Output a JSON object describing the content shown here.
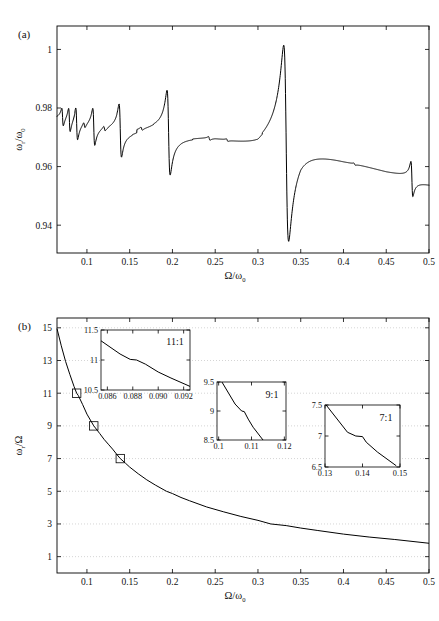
{
  "figure": {
    "panel_a_label": "(a)",
    "panel_b_label": "(b)"
  },
  "chart_data": [
    {
      "id": "panel_a",
      "type": "line",
      "title": "",
      "panel": "(a)",
      "xlabel": "Ω/ω₀",
      "ylabel": "ω_r/ω₀",
      "xlabel_parts": {
        "main": "Ω/ω",
        "sub": "0"
      },
      "ylabel_parts": {
        "num": "ω",
        "num_sub": "r",
        "den": "ω",
        "den_sub": "0"
      },
      "xlim": [
        0.065,
        0.5
      ],
      "ylim": [
        0.9305,
        1.008
      ],
      "xticks": [
        0.1,
        0.15,
        0.2,
        0.25,
        0.3,
        0.35,
        0.4,
        0.45,
        0.5
      ],
      "xticklabels": [
        "0.1",
        "0.15",
        "0.2",
        "0.25",
        "0.3",
        "0.35",
        "0.4",
        "0.45",
        "0.5"
      ],
      "yticks": [
        0.94,
        0.96,
        0.98,
        1
      ],
      "yticklabels": [
        "0.94",
        "0.96",
        "0.98",
        "1"
      ],
      "grid": false,
      "description": "Resonance-width curve with antisymmetric dispersive resonances at odd-ratio commensurabilities; baseline decays from ~0.9745 to ~0.9555.",
      "resonances": [
        {
          "x": 0.0715,
          "peak": 0.9775,
          "trough": 0.9715,
          "ratio": "13:1"
        },
        {
          "x": 0.0795,
          "peak": 0.9785,
          "trough": 0.9705,
          "ratio": "12:1"
        },
        {
          "x": 0.088,
          "peak": 0.9795,
          "trough": 0.9688,
          "ratio": "11:1"
        },
        {
          "x": 0.097,
          "peak": 0.974,
          "trough": 0.972,
          "ratio": "10.5:1"
        },
        {
          "x": 0.108,
          "peak": 0.98,
          "trough": 0.9678,
          "ratio": "9:1"
        },
        {
          "x": 0.1205,
          "peak": 0.9735,
          "trough": 0.9718,
          "ratio": "8:1"
        },
        {
          "x": 0.139,
          "peak": 0.9818,
          "trough": 0.9645,
          "ratio": "7:1"
        },
        {
          "x": 0.164,
          "peak": 0.9723,
          "trough": 0.9712,
          "ratio": "6:1"
        },
        {
          "x": 0.1955,
          "peak": 0.9848,
          "trough": 0.9573,
          "ratio": "5:1"
        },
        {
          "x": 0.243,
          "peak": 0.97,
          "trough": 0.9688,
          "ratio": "4:1"
        },
        {
          "x": 0.264,
          "peak": 0.9668,
          "trough": 0.966,
          "ratio": "3.5:1"
        },
        {
          "x": 0.333,
          "peak": 1.0005,
          "trough": 0.9362,
          "ratio": "3:1"
        },
        {
          "x": 0.413,
          "peak": 0.9628,
          "trough": 0.962,
          "ratio": "2.5:1"
        },
        {
          "x": 0.48,
          "peak": 0.9635,
          "trough": 0.9522,
          "ratio": "2:1"
        }
      ],
      "baseline": [
        {
          "x": 0.065,
          "y": 0.9745
        },
        {
          "x": 0.1,
          "y": 0.9735
        },
        {
          "x": 0.15,
          "y": 0.9718
        },
        {
          "x": 0.2,
          "y": 0.9705
        },
        {
          "x": 0.25,
          "y": 0.9682
        },
        {
          "x": 0.3,
          "y": 0.964
        },
        {
          "x": 0.35,
          "y": 0.97
        },
        {
          "x": 0.4,
          "y": 0.9645
        },
        {
          "x": 0.45,
          "y": 0.9595
        },
        {
          "x": 0.5,
          "y": 0.9555
        }
      ]
    },
    {
      "id": "panel_b",
      "type": "line",
      "title": "",
      "panel": "(b)",
      "xlabel": "Ω/ω₀",
      "ylabel": "ω_r/Ω",
      "xlabel_parts": {
        "main": "Ω/ω",
        "sub": "0"
      },
      "ylabel_parts": {
        "num": "ω",
        "num_sub": "r",
        "den": "Ω"
      },
      "xlim": [
        0.065,
        0.5
      ],
      "ylim": [
        0.0,
        15.6
      ],
      "xticks": [
        0.1,
        0.15,
        0.2,
        0.25,
        0.3,
        0.35,
        0.4,
        0.45,
        0.5
      ],
      "xticklabels": [
        "0.1",
        "0.15",
        "0.2",
        "0.25",
        "0.3",
        "0.35",
        "0.4",
        "0.45",
        "0.5"
      ],
      "yticks": [
        1,
        3,
        5,
        7,
        9,
        11,
        13,
        15
      ],
      "yticklabels": [
        "1",
        "3",
        "5",
        "7",
        "9",
        "11",
        "13",
        "15"
      ],
      "grid": true,
      "description": "Ratio of resonance frequency to drive frequency, monotonically decreasing staircase through odd integer plateaus.",
      "x": [
        0.065,
        0.07,
        0.075,
        0.08,
        0.085,
        0.088,
        0.09,
        0.095,
        0.1,
        0.108,
        0.11,
        0.115,
        0.12,
        0.125,
        0.13,
        0.135,
        0.139,
        0.145,
        0.15,
        0.16,
        0.17,
        0.18,
        0.193,
        0.2,
        0.21,
        0.22,
        0.24,
        0.26,
        0.28,
        0.3,
        0.315,
        0.333,
        0.35,
        0.37,
        0.4,
        0.43,
        0.46,
        0.5
      ],
      "y": [
        14.95,
        13.9,
        12.95,
        12.15,
        11.4,
        11.0,
        10.85,
        10.3,
        9.72,
        9.0,
        8.87,
        8.53,
        8.18,
        7.88,
        7.58,
        7.25,
        7.0,
        6.72,
        6.48,
        6.07,
        5.7,
        5.38,
        5.0,
        4.86,
        4.62,
        4.42,
        4.04,
        3.74,
        3.46,
        3.22,
        3.0,
        2.9,
        2.75,
        2.6,
        2.38,
        2.2,
        2.05,
        1.82
      ],
      "markers": [
        {
          "x": 0.088,
          "y": 11
        },
        {
          "x": 0.108,
          "y": 9
        },
        {
          "x": 0.139,
          "y": 7
        }
      ],
      "insets": [
        {
          "id": "inset_11_1",
          "label": "11:1",
          "xlim": [
            0.0855,
            0.0925
          ],
          "ylim": [
            10.5,
            11.5
          ],
          "xticks": [
            0.086,
            0.088,
            0.09,
            0.092
          ],
          "xticklabels": [
            "0.086",
            "0.088",
            "0.090",
            "0.092"
          ],
          "yticks": [
            10.5,
            11,
            11.5
          ],
          "yticklabels": [
            "10.5",
            "11",
            "11.5"
          ],
          "x": [
            0.0855,
            0.087,
            0.0878,
            0.0883,
            0.089,
            0.09,
            0.091,
            0.0925
          ],
          "y": [
            11.32,
            11.1,
            11.01,
            11.0,
            10.93,
            10.8,
            10.7,
            10.56
          ]
        },
        {
          "id": "inset_9_1",
          "label": "9:1",
          "xlim": [
            0.0995,
            0.1205
          ],
          "ylim": [
            8.5,
            9.5
          ],
          "xticks": [
            0.1,
            0.11,
            0.12
          ],
          "xticklabels": [
            "0.1",
            "0.11",
            "0.12"
          ],
          "yticks": [
            8.5,
            9,
            9.5
          ],
          "yticklabels": [
            "8.5",
            "9",
            "9.5"
          ],
          "x": [
            0.101,
            0.105,
            0.107,
            0.1078,
            0.109,
            0.1105,
            0.1135
          ],
          "y": [
            9.5,
            9.12,
            9.0,
            8.99,
            8.86,
            8.72,
            8.5
          ]
        },
        {
          "id": "inset_7_1",
          "label": "7:1",
          "xlim": [
            0.13,
            0.15
          ],
          "ylim": [
            6.5,
            7.5
          ],
          "xticks": [
            0.13,
            0.14,
            0.15
          ],
          "xticklabels": [
            "0.13",
            "0.14",
            "0.15"
          ],
          "yticks": [
            6.5,
            7,
            7.5
          ],
          "yticklabels": [
            "6.5",
            "7",
            "7.5"
          ],
          "x": [
            0.1303,
            0.136,
            0.1382,
            0.14,
            0.141,
            0.144,
            0.149
          ],
          "y": [
            7.5,
            7.06,
            7.0,
            6.99,
            6.9,
            6.74,
            6.52
          ]
        }
      ]
    }
  ]
}
